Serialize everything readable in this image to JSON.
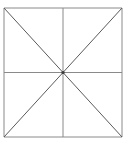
{
  "figure": {
    "canvas": {
      "width": 125,
      "height": 161,
      "background_color": "#ffffff"
    },
    "square": {
      "name": "outer-square",
      "left": 4,
      "top": 8,
      "right": 122,
      "bottom": 137,
      "width": 118,
      "height": 129,
      "stroke_color": "#8a8a8a",
      "stroke_width": 1
    },
    "center_point": {
      "name": "center-vertex",
      "x": 63,
      "y": 72.5,
      "color": "#3c3c3c",
      "radius": 1.6
    },
    "lines": [
      {
        "name": "square-top-edge",
        "kind": "edge",
        "x1": 4,
        "y1": 8,
        "x2": 122,
        "y2": 8,
        "color": "#8a8a8a",
        "width": 1
      },
      {
        "name": "square-right-edge",
        "kind": "edge",
        "x1": 122,
        "y1": 8,
        "x2": 122,
        "y2": 137,
        "color": "#8a8a8a",
        "width": 1
      },
      {
        "name": "square-bottom-edge",
        "kind": "edge",
        "x1": 122,
        "y1": 137,
        "x2": 4,
        "y2": 137,
        "color": "#8a8a8a",
        "width": 1
      },
      {
        "name": "square-left-edge",
        "kind": "edge",
        "x1": 4,
        "y1": 137,
        "x2": 4,
        "y2": 8,
        "color": "#8a8a8a",
        "width": 1
      },
      {
        "name": "horizontal-midline",
        "kind": "midline",
        "x1": 4,
        "y1": 72.5,
        "x2": 122,
        "y2": 72.5,
        "color": "#8a8a8a",
        "width": 1
      },
      {
        "name": "vertical-midline",
        "kind": "midline",
        "x1": 63,
        "y1": 8,
        "x2": 63,
        "y2": 137,
        "color": "#8a8a8a",
        "width": 1
      },
      {
        "name": "diagonal-topleft-bottomright",
        "kind": "diagonal",
        "x1": 4,
        "y1": 8,
        "x2": 122,
        "y2": 137,
        "color": "#5a5a5a",
        "width": 1
      },
      {
        "name": "diagonal-topright-bottomleft",
        "kind": "diagonal",
        "x1": 122,
        "y1": 8,
        "x2": 4,
        "y2": 137,
        "color": "#5a5a5a",
        "width": 1
      }
    ]
  }
}
